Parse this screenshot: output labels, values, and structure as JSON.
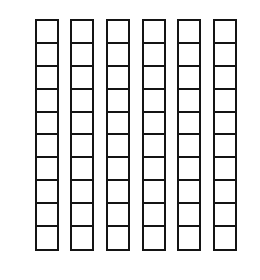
{
  "diagram": {
    "rod_count": 6,
    "cells_per_rod": 10,
    "total_units": 60,
    "line_color": "#141414",
    "background_color": "#ffffff",
    "rods": [
      {
        "index": 1,
        "x": 34.5,
        "cells": 10
      },
      {
        "index": 2,
        "x": 70,
        "cells": 10
      },
      {
        "index": 3,
        "x": 105.5,
        "cells": 10
      },
      {
        "index": 4,
        "x": 141.5,
        "cells": 10
      },
      {
        "index": 5,
        "x": 177,
        "cells": 10
      },
      {
        "index": 6,
        "x": 212.5,
        "cells": 10
      }
    ]
  }
}
